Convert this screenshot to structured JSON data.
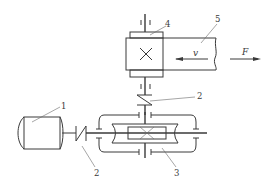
{
  "diagram": {
    "type": "mechanical-transmission-schematic",
    "labels": {
      "motor": "1",
      "coupling_left": "2",
      "coupling_top": "2",
      "reducer": "3",
      "drum": "4",
      "belt": "5"
    },
    "symbols": {
      "velocity": "v",
      "force": "F"
    },
    "components": [
      {
        "id": "1",
        "name": "electric-motor"
      },
      {
        "id": "2",
        "name": "coupling"
      },
      {
        "id": "3",
        "name": "gear-reducer"
      },
      {
        "id": "4",
        "name": "drum"
      },
      {
        "id": "5",
        "name": "conveyor-belt"
      }
    ]
  }
}
